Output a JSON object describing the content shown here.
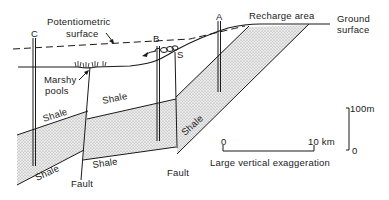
{
  "diagram": {
    "type": "geological cross-section (artesian aquifer system)",
    "labels": {
      "potentiometric_line1": "Potentiometric",
      "potentiometric_line2": "surface",
      "recharge_area": "Recharge area",
      "ground_line1": "Ground",
      "ground_line2": "surface",
      "marshy_line1": "Marshy",
      "marshy_line2": "pools",
      "spring": "S",
      "fault_left": "Fault",
      "fault_right": "Fault",
      "shale_upper_left": "Shale",
      "shale_upper_middle": "Shale",
      "shale_lower_left": "Shale",
      "shale_lower_middle": "Shale",
      "shale_lower_right": "Shale"
    },
    "wells": [
      {
        "id": "C",
        "label": "C"
      },
      {
        "id": "B",
        "label": "B"
      },
      {
        "id": "A",
        "label": "A"
      }
    ],
    "horizontal_scale": {
      "start": "0",
      "end": "10 km",
      "caption": "Large vertical exaggeration"
    },
    "vertical_scale": {
      "top": "100m",
      "bottom": "0"
    },
    "colors": {
      "ink": "#1a1a1a",
      "aquifer_fill": "#d9d9d9",
      "background": "#ffffff"
    }
  }
}
